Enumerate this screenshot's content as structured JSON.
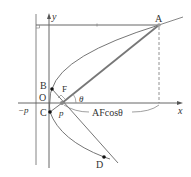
{
  "diagram": {
    "labels": {
      "y_axis": "y",
      "x_axis": "x",
      "origin": "O",
      "neg_p": "−p",
      "p": "p",
      "point_A": "A",
      "point_B": "B",
      "point_C": "C",
      "point_D": "D",
      "focus": "F",
      "angle": "θ",
      "projection": "AFcosθ"
    },
    "colors": {
      "axis": "#555555",
      "curve": "#666666",
      "focal_line": "#777777",
      "point": "#111111",
      "text": "#333333"
    }
  }
}
